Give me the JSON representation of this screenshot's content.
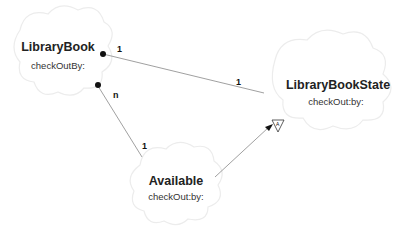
{
  "diagram": {
    "nodes": [
      {
        "id": "library-book",
        "name": "LibraryBook",
        "method": "checkOutBy:"
      },
      {
        "id": "library-book-state",
        "name": "LibraryBookState",
        "method": "checkOut:by:"
      },
      {
        "id": "available",
        "name": "Available",
        "method": "checkOut:by:"
      }
    ],
    "edges": [
      {
        "from": "LibraryBook",
        "to": "LibraryBookState",
        "type": "association",
        "from_mult": "1",
        "to_mult": "1"
      },
      {
        "from": "LibraryBook",
        "to": "Available",
        "type": "association",
        "from_mult": "n",
        "to_mult": "1"
      },
      {
        "from": "Available",
        "to": "LibraryBookState",
        "type": "inheritance",
        "marker": "A"
      }
    ]
  }
}
